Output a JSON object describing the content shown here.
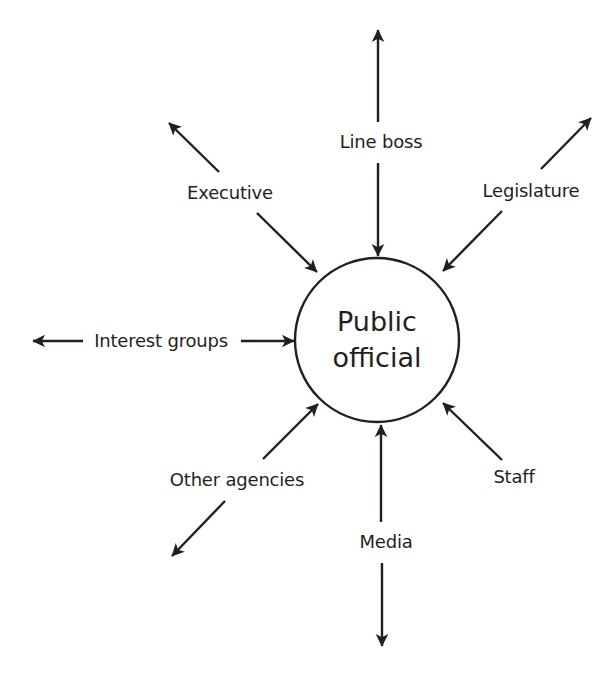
{
  "center": {
    "line1": "Public",
    "line2": "official"
  },
  "nodes": {
    "line_boss": "Line boss",
    "executive": "Executive",
    "legislature": "Legislature",
    "interest_groups": "Interest groups",
    "other_agencies": "Other agencies",
    "media": "Media",
    "staff": "Staff"
  },
  "colors": {
    "stroke": "#231f20",
    "background": "#ffffff"
  }
}
